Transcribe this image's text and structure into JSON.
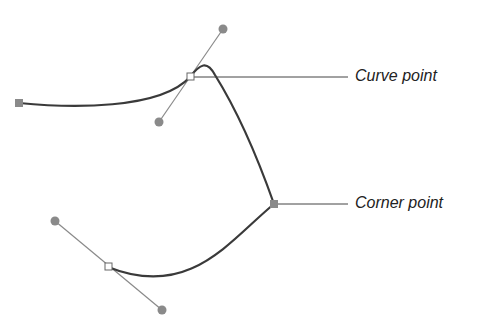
{
  "diagram": {
    "labels": {
      "curve_point": "Curve point",
      "corner_point": "Corner point"
    },
    "colors": {
      "path": "#3a3a3a",
      "handle": "#8a8a8a",
      "anchor": "#8a8a8a",
      "leader": "#444444"
    }
  }
}
